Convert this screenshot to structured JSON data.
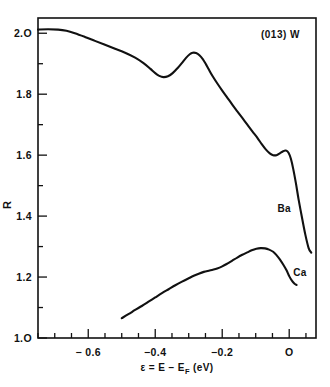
{
  "figure": {
    "annotation": "(013) W",
    "background": "#ffffff",
    "ink_color": "#111111"
  },
  "chart_data": {
    "type": "line",
    "title": "",
    "annotation": "(013) W",
    "xlabel": "ε = E − E_F   (eV)",
    "ylabel": "R",
    "xlim": [
      -0.75,
      0.08
    ],
    "ylim": [
      1.0,
      2.05
    ],
    "grid": false,
    "legend": "inline-curve-labels",
    "xticks": [
      -0.75,
      -0.7,
      -0.65,
      -0.6,
      -0.55,
      -0.5,
      -0.45,
      -0.4,
      -0.35,
      -0.3,
      -0.25,
      -0.2,
      -0.15,
      -0.1,
      -0.05,
      0.0,
      0.05
    ],
    "xtick_labels": [
      {
        "value": -0.6,
        "label": "− 0.6"
      },
      {
        "value": -0.4,
        "label": "−0.4"
      },
      {
        "value": -0.2,
        "label": "−0.2"
      },
      {
        "value": 0.0,
        "label": "O"
      }
    ],
    "yticks": [
      1.0,
      1.1,
      1.2,
      1.3,
      1.4,
      1.5,
      1.6,
      1.7,
      1.8,
      1.9,
      2.0
    ],
    "ytick_labels": [
      {
        "value": 1.0,
        "label": "1.O"
      },
      {
        "value": 1.2,
        "label": "1.2"
      },
      {
        "value": 1.4,
        "label": "1.4"
      },
      {
        "value": 1.6,
        "label": "1.6"
      },
      {
        "value": 1.8,
        "label": "1.8"
      },
      {
        "value": 2.0,
        "label": "2.O"
      }
    ],
    "series": [
      {
        "name": "Ba",
        "label": "Ba",
        "label_x": -0.035,
        "label_y": 1.415,
        "points": [
          [
            -0.75,
            2.012
          ],
          [
            -0.72,
            2.013
          ],
          [
            -0.69,
            2.012
          ],
          [
            -0.665,
            2.008
          ],
          [
            -0.64,
            2.0
          ],
          [
            -0.61,
            1.988
          ],
          [
            -0.58,
            1.975
          ],
          [
            -0.55,
            1.962
          ],
          [
            -0.52,
            1.949
          ],
          [
            -0.49,
            1.936
          ],
          [
            -0.46,
            1.92
          ],
          [
            -0.435,
            1.902
          ],
          [
            -0.415,
            1.884
          ],
          [
            -0.4,
            1.869
          ],
          [
            -0.388,
            1.86
          ],
          [
            -0.375,
            1.856
          ],
          [
            -0.362,
            1.859
          ],
          [
            -0.348,
            1.869
          ],
          [
            -0.333,
            1.886
          ],
          [
            -0.32,
            1.903
          ],
          [
            -0.308,
            1.919
          ],
          [
            -0.297,
            1.931
          ],
          [
            -0.288,
            1.936
          ],
          [
            -0.278,
            1.935
          ],
          [
            -0.268,
            1.928
          ],
          [
            -0.258,
            1.915
          ],
          [
            -0.248,
            1.897
          ],
          [
            -0.238,
            1.877
          ],
          [
            -0.228,
            1.858
          ],
          [
            -0.215,
            1.836
          ],
          [
            -0.2,
            1.812
          ],
          [
            -0.185,
            1.789
          ],
          [
            -0.17,
            1.766
          ],
          [
            -0.155,
            1.744
          ],
          [
            -0.14,
            1.722
          ],
          [
            -0.125,
            1.7
          ],
          [
            -0.11,
            1.678
          ],
          [
            -0.095,
            1.657
          ],
          [
            -0.082,
            1.636
          ],
          [
            -0.07,
            1.619
          ],
          [
            -0.058,
            1.606
          ],
          [
            -0.048,
            1.6
          ],
          [
            -0.038,
            1.6
          ],
          [
            -0.028,
            1.606
          ],
          [
            -0.018,
            1.613
          ],
          [
            -0.01,
            1.615
          ],
          [
            -0.002,
            1.608
          ],
          [
            0.005,
            1.588
          ],
          [
            0.012,
            1.555
          ],
          [
            0.02,
            1.508
          ],
          [
            0.028,
            1.455
          ],
          [
            0.038,
            1.396
          ],
          [
            0.048,
            1.34
          ],
          [
            0.058,
            1.295
          ],
          [
            0.066,
            1.28
          ]
        ]
      },
      {
        "name": "Ca",
        "label": "Ca",
        "label_x": 0.012,
        "label_y": 1.205,
        "points": [
          [
            -0.5,
            1.065
          ],
          [
            -0.48,
            1.078
          ],
          [
            -0.46,
            1.092
          ],
          [
            -0.44,
            1.105
          ],
          [
            -0.42,
            1.119
          ],
          [
            -0.4,
            1.133
          ],
          [
            -0.38,
            1.147
          ],
          [
            -0.36,
            1.16
          ],
          [
            -0.34,
            1.173
          ],
          [
            -0.32,
            1.185
          ],
          [
            -0.3,
            1.196
          ],
          [
            -0.285,
            1.204
          ],
          [
            -0.27,
            1.211
          ],
          [
            -0.255,
            1.217
          ],
          [
            -0.24,
            1.221
          ],
          [
            -0.228,
            1.224
          ],
          [
            -0.215,
            1.228
          ],
          [
            -0.2,
            1.235
          ],
          [
            -0.185,
            1.244
          ],
          [
            -0.17,
            1.254
          ],
          [
            -0.155,
            1.264
          ],
          [
            -0.14,
            1.273
          ],
          [
            -0.125,
            1.281
          ],
          [
            -0.112,
            1.288
          ],
          [
            -0.098,
            1.293
          ],
          [
            -0.085,
            1.295
          ],
          [
            -0.072,
            1.294
          ],
          [
            -0.06,
            1.29
          ],
          [
            -0.048,
            1.283
          ],
          [
            -0.038,
            1.272
          ],
          [
            -0.028,
            1.258
          ],
          [
            -0.018,
            1.241
          ],
          [
            -0.008,
            1.222
          ],
          [
            0.0,
            1.203
          ],
          [
            0.008,
            1.188
          ],
          [
            0.016,
            1.178
          ],
          [
            0.022,
            1.174
          ]
        ]
      }
    ]
  }
}
